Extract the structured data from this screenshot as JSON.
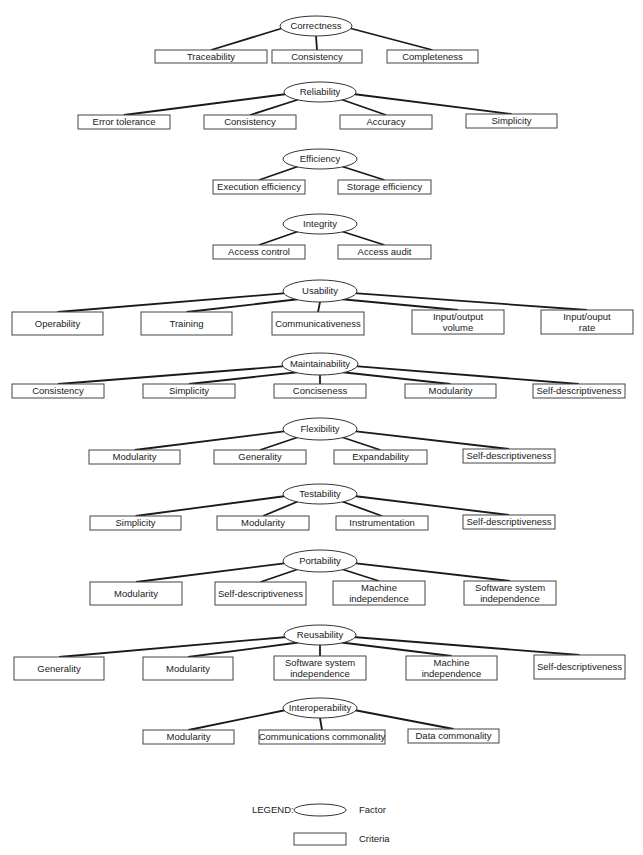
{
  "diagram": {
    "factors": [
      {
        "name": "Correctness",
        "criteria": [
          "Traceability",
          "Consistency",
          "Completeness"
        ]
      },
      {
        "name": "Reliability",
        "criteria": [
          "Error tolerance",
          "Consistency",
          "Accuracy",
          "Simplicity"
        ]
      },
      {
        "name": "Efficiency",
        "criteria": [
          "Execution efficiency",
          "Storage efficiency"
        ]
      },
      {
        "name": "Integrity",
        "criteria": [
          "Access control",
          "Access audit"
        ]
      },
      {
        "name": "Usability",
        "criteria": [
          "Operability",
          "Training",
          "Communicativeness",
          [
            "Input/output",
            "volume"
          ],
          [
            "Input/ouput",
            "rate"
          ]
        ]
      },
      {
        "name": "Maintainability",
        "criteria": [
          "Consistency",
          "Simplicity",
          "Conciseness",
          "Modularity",
          "Self-descriptiveness"
        ]
      },
      {
        "name": "Flexibility",
        "criteria": [
          "Modularity",
          "Generality",
          "Expandability",
          "Self-descriptiveness"
        ]
      },
      {
        "name": "Testability",
        "criteria": [
          "Simplicity",
          "Modularity",
          "Instrumentation",
          "Self-descriptiveness"
        ]
      },
      {
        "name": "Portability",
        "criteria": [
          "Modularity",
          "Self-descriptiveness",
          [
            "Machine",
            "independence"
          ],
          [
            "Software system",
            "independence"
          ]
        ]
      },
      {
        "name": "Reusability",
        "criteria": [
          "Generality",
          "Modularity",
          [
            "Software system",
            "independence"
          ],
          [
            "Machine",
            "independence"
          ],
          "Self-descriptiveness"
        ]
      },
      {
        "name": "Interoperability",
        "criteria": [
          "Modularity",
          "Communications commonality",
          "Data commonality"
        ]
      }
    ]
  },
  "legend": {
    "title": "LEGEND:",
    "factor_label": "Factor",
    "criteria_label": "Criteria"
  }
}
